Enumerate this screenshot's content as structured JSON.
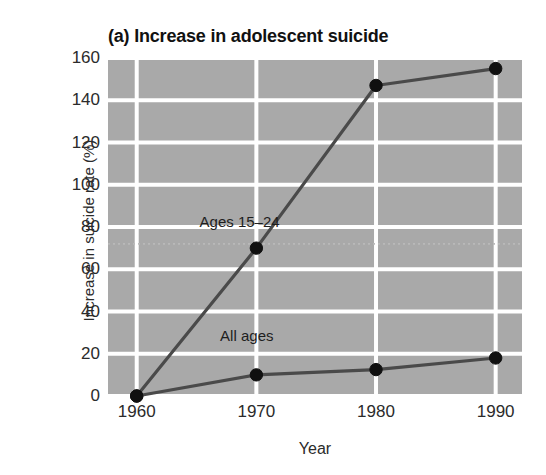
{
  "chart_data": {
    "type": "line",
    "title": "(a) Increase in adolescent suicide",
    "subtitle": "",
    "xlabel": "Year",
    "ylabel": "Increase in suicide rate (%)",
    "x": [
      1960,
      1970,
      1980,
      1990
    ],
    "xticklabels": [
      "1960",
      "1970",
      "1980",
      "1990"
    ],
    "yticks": [
      0,
      20,
      40,
      60,
      80,
      100,
      120,
      140,
      160
    ],
    "yticklabels": [
      "0",
      "20",
      "40",
      "60",
      "80",
      "100",
      "120",
      "140",
      "160"
    ],
    "xlim": [
      1957.6,
      1992.2
    ],
    "ylim": [
      0,
      160
    ],
    "grid": true,
    "grid_color": "#ffffff",
    "plot_background": "#a9a9a9",
    "legend": "inline-annotations",
    "series": [
      {
        "name": "Ages 15-24",
        "label": "Ages 15–24",
        "values": [
          0,
          70,
          147,
          155
        ],
        "color": "#4a4a4a",
        "marker": "circle",
        "marker_color": "#101010",
        "label_x": 1968.6,
        "label_y": 83
      },
      {
        "name": "All ages",
        "label": "All ages",
        "values": [
          0,
          10,
          12.5,
          18
        ],
        "color": "#4a4a4a",
        "marker": "circle",
        "marker_color": "#101010",
        "label_x": 1969.2,
        "label_y": 29
      }
    ],
    "annotations": [
      {
        "name": "faint-reference-line",
        "type": "hline",
        "y": 72,
        "style": "dotted",
        "color": "#b9b9b9"
      }
    ]
  },
  "axis_titles": {
    "x": "Year",
    "y": "Increase in suicide rate (%)"
  },
  "title": "(a) Increase in adolescent suicide"
}
